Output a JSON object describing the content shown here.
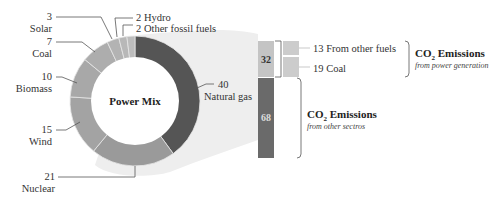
{
  "chart_data": {
    "type": "pie",
    "title": "Power Mix",
    "donut": true,
    "categories": [
      "Natural gas",
      "Nuclear",
      "Wind",
      "Biomass",
      "Coal",
      "Solar",
      "Hydro",
      "Other fossil fuels"
    ],
    "values": [
      40,
      21,
      15,
      10,
      7,
      3,
      2,
      2
    ],
    "unit": "%",
    "colors": [
      "#555555",
      "#9a9a9a",
      "#a3a3a3",
      "#a8a8a8",
      "#adadad",
      "#b3b3b3",
      "#b8b8b8",
      "#bdbdbd"
    ],
    "linked_bar": {
      "type": "stacked_bar",
      "segments": [
        {
          "label": "32",
          "value": 32,
          "color": "#c4c4c4",
          "breakdown": [
            {
              "value": 13,
              "label": "From other fuels"
            },
            {
              "value": 19,
              "label": "Coal"
            }
          ],
          "group_title": "CO2 Emissions",
          "group_subtitle": "from power generation"
        },
        {
          "label": "68",
          "value": 68,
          "color": "#6a6a6a",
          "group_title": "CO2 Emissions",
          "group_subtitle": "from other sectros"
        }
      ]
    }
  },
  "donut": {
    "center_label": "Power Mix",
    "labels": [
      {
        "num": "40",
        "name": "Natural gas"
      },
      {
        "num": "21",
        "name": "Nuclear"
      },
      {
        "num": "15",
        "name": "Wind"
      },
      {
        "num": "10",
        "name": "Biomass"
      },
      {
        "num": "7",
        "name": "Coal"
      },
      {
        "num": "3",
        "name": "Solar"
      },
      {
        "num": "2",
        "name": "Hydro",
        "full": "2 Hydro"
      },
      {
        "num": "2",
        "name": "Other fossil fuels",
        "full": "2 Other fossil fuels"
      }
    ]
  },
  "bar": {
    "top_value": "32",
    "bottom_value": "68",
    "breakdown": [
      {
        "text": "13 From other fuels"
      },
      {
        "text": "19 Coal"
      }
    ]
  },
  "emissions": {
    "power": {
      "title_prefix": "CO",
      "title_sub": "2",
      "title_suffix": " Emissions",
      "subtitle": "from power generation"
    },
    "other": {
      "title_prefix": "CO",
      "title_sub": "2",
      "title_suffix": " Emissions",
      "subtitle": "from other sectros"
    }
  }
}
